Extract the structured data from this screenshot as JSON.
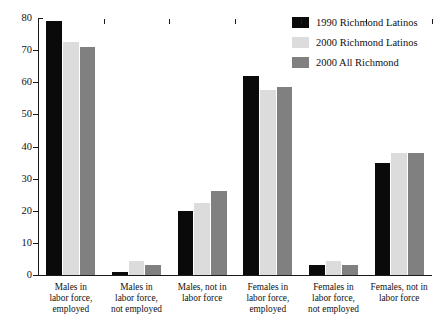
{
  "chart_data": {
    "type": "bar",
    "title": "",
    "subtitle": "",
    "xlabel": "",
    "ylabel": "",
    "ylim": [
      0,
      80
    ],
    "yticks": [
      0,
      10,
      20,
      30,
      40,
      50,
      60,
      70,
      80
    ],
    "grid": false,
    "legend_position": "top-right",
    "categories": [
      "Males in labor force, employed",
      "Males in labor force, not employed",
      "Males, not in labor force",
      "Females in labor force, employed",
      "Females in labor force, not employed",
      "Females, not in labor force"
    ],
    "category_lines": [
      [
        "Males in",
        "labor force,",
        "employed"
      ],
      [
        "Males in",
        "labor force,",
        "not employed"
      ],
      [
        "Males, not in",
        "labor force"
      ],
      [
        "Females in",
        "labor force,",
        "employed"
      ],
      [
        "Females in",
        "labor force,",
        "not employed"
      ],
      [
        "Females, not in",
        "labor force"
      ]
    ],
    "series": [
      {
        "name": "1990 Richmond Latinos",
        "color": "#0a0a0a",
        "values": [
          79,
          1,
          20,
          62,
          3,
          35
        ]
      },
      {
        "name": "2000 Richmond Latinos",
        "color": "#dcdcdc",
        "values": [
          72.5,
          4.5,
          22.5,
          57.5,
          4.5,
          38
        ]
      },
      {
        "name": "2000 All Richmond",
        "color": "#808080",
        "values": [
          71,
          3,
          26,
          58.5,
          3,
          38
        ]
      }
    ]
  },
  "legend": {
    "items": [
      {
        "label": "1990 Richmond Latinos",
        "color": "#0a0a0a"
      },
      {
        "label": "2000 Richmond Latinos",
        "color": "#dcdcdc"
      },
      {
        "label": "2000 All Richmond",
        "color": "#808080"
      }
    ]
  }
}
